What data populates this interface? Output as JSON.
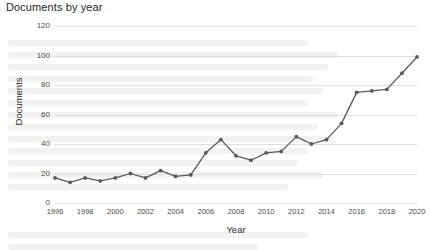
{
  "figure": {
    "title": "Documents by year"
  },
  "chart_data": {
    "type": "line",
    "title": "Documents by year",
    "xlabel": "Year",
    "ylabel": "Documents",
    "grid": true,
    "legend": "none",
    "marker": "circle",
    "line_color": "#595959",
    "marker_color": "#595959",
    "grid_color": "#dedede",
    "xlim": [
      1996,
      2020
    ],
    "ylim": [
      0,
      120
    ],
    "y_ticks": [
      0,
      20,
      40,
      60,
      80,
      100,
      120
    ],
    "x_ticks": [
      1996,
      1998,
      2000,
      2002,
      2004,
      2006,
      2008,
      2010,
      2012,
      2014,
      2016,
      2018,
      2020
    ],
    "x": [
      1996,
      1997,
      1998,
      1999,
      2000,
      2001,
      2002,
      2003,
      2004,
      2005,
      2006,
      2007,
      2008,
      2009,
      2010,
      2011,
      2012,
      2013,
      2014,
      2015,
      2016,
      2017,
      2018,
      2019,
      2020
    ],
    "values": [
      17,
      14,
      17,
      15,
      17,
      20,
      17,
      22,
      18,
      19,
      34,
      43,
      32,
      29,
      34,
      35,
      45,
      40,
      43,
      54,
      75,
      76,
      77,
      88,
      99
    ]
  }
}
